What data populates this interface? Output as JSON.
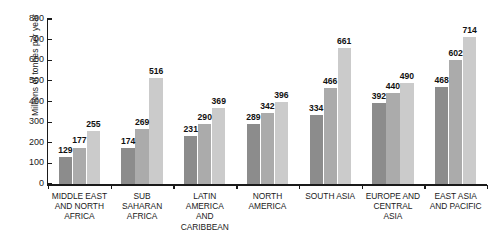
{
  "chart_data": {
    "type": "bar",
    "title": "",
    "xlabel": "",
    "ylabel": "Millions of tonnes per year",
    "ylim": [
      0,
      800
    ],
    "yticks": [
      0,
      100,
      200,
      300,
      400,
      500,
      600,
      700,
      800
    ],
    "ytick_labels": [
      "0",
      "100",
      "200",
      "300",
      "400",
      "500",
      "600",
      "700",
      "800"
    ],
    "grid": false,
    "legend": "none",
    "bar_value_labels": true,
    "categories": [
      "MIDDLE EAST AND NORTH AFRICA",
      "SUB SAHARAN AFRICA",
      "LATIN AMERICA AND CARIBBEAN",
      "NORTH AMERICA",
      "SOUTH ASIA",
      "EUROPE AND CENTRAL ASIA",
      "EAST ASIA AND PACIFIC"
    ],
    "category_label_lines": [
      [
        "MIDDLE EAST",
        "AND NORTH",
        "AFRICA"
      ],
      [
        "SUB",
        "SAHARAN",
        "AFRICA"
      ],
      [
        "LATIN",
        "AMERICA",
        "AND",
        "CARIBBEAN"
      ],
      [
        "NORTH",
        "AMERICA"
      ],
      [
        "SOUTH ASIA"
      ],
      [
        "EUROPE AND",
        "CENTRAL",
        "ASIA"
      ],
      [
        "EAST ASIA",
        "AND PACIFIC"
      ]
    ],
    "series": [
      {
        "name": "series-1",
        "color": "#8c8c8c",
        "values": [
          129,
          174,
          231,
          289,
          334,
          392,
          468
        ]
      },
      {
        "name": "series-2",
        "color": "#ababab",
        "values": [
          177,
          269,
          290,
          342,
          466,
          440,
          602
        ]
      },
      {
        "name": "series-3",
        "color": "#cbcbcb",
        "values": [
          255,
          516,
          369,
          396,
          661,
          490,
          714
        ]
      }
    ]
  },
  "colors": {
    "axis": "#1a1a1a",
    "background": "#ffffff",
    "series_1": "#8c8c8c",
    "series_2": "#ababab",
    "series_3": "#cbcbcb"
  }
}
